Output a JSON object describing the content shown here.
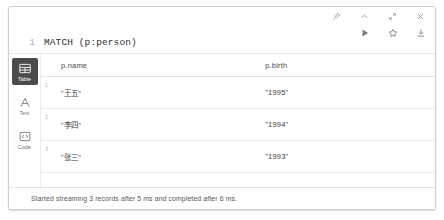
{
  "editor": {
    "lines": [
      {
        "number": "1",
        "text": "MATCH (p:person)"
      },
      {
        "number": "2",
        "text": "RETURN p.name, p.birth"
      },
      {
        "number": "3",
        "text": "ORDER BY p.birth DESC"
      }
    ],
    "top_icons": [
      {
        "name": "pin-icon",
        "title": "Pin"
      },
      {
        "name": "chevron-up-icon",
        "title": "Collapse"
      },
      {
        "name": "expand-icon",
        "title": "Expand"
      },
      {
        "name": "close-icon",
        "title": "Close"
      }
    ],
    "action_icons": [
      {
        "name": "run-icon",
        "title": "Run"
      },
      {
        "name": "star-icon",
        "title": "Favorite"
      },
      {
        "name": "download-icon",
        "title": "Download"
      }
    ]
  },
  "view_switcher": {
    "items": [
      {
        "label": "Table",
        "icon": "table-icon",
        "active": true
      },
      {
        "label": "Text",
        "icon": "text-icon",
        "active": false
      },
      {
        "label": "Code",
        "icon": "code-icon",
        "active": false
      }
    ]
  },
  "table": {
    "columns": [
      "p.name",
      "p.birth"
    ],
    "rows": [
      {
        "index": "1",
        "name": "\"王五\"",
        "birth": "\"1995\""
      },
      {
        "index": "2",
        "name": "\"李四\"",
        "birth": "\"1994\""
      },
      {
        "index": "3",
        "name": "\"张三\"",
        "birth": "\"1993\""
      }
    ]
  },
  "status": {
    "message": "Started streaming 3 records after 5 ms and completed after 6 ms."
  },
  "colors": {
    "active_tab_bg": "#4b4b4b",
    "border": "#cfcfcf",
    "text": "#3c3c3c"
  }
}
